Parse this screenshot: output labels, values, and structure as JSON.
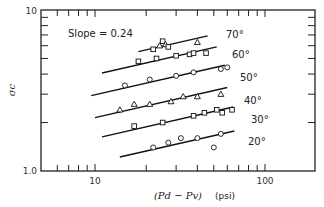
{
  "chart_data": {
    "type": "scatter",
    "title": "",
    "xlabel": "(P_d − P_v) (psi)",
    "ylabel": "σ_c",
    "xscale": "log",
    "yscale": "log",
    "xlim": [
      4.8,
      200
    ],
    "ylim": [
      1.0,
      10
    ],
    "x_tick_labels": [
      "10",
      "100"
    ],
    "y_tick_labels": [
      "1.0",
      "10"
    ],
    "grid": false,
    "legend": "none (series labeled at line ends)",
    "annotations": [
      {
        "text": "Slope = 0.24"
      }
    ],
    "series": [
      {
        "name": "70°",
        "marker": "triangle/square",
        "fit_slope": 0.24,
        "x": [
          22,
          24,
          25,
          26,
          27,
          40
        ],
        "y": [
          5.7,
          6.0,
          6.4,
          6.1,
          5.9,
          6.3
        ]
      },
      {
        "name": "60°",
        "marker": "square",
        "fit_slope": 0.24,
        "x": [
          18,
          23,
          30,
          36,
          38,
          45
        ],
        "y": [
          4.8,
          5.0,
          5.2,
          5.3,
          5.4,
          5.4
        ]
      },
      {
        "name": "50°",
        "marker": "circle",
        "fit_slope": 0.24,
        "x": [
          15,
          21,
          30,
          38,
          55,
          60
        ],
        "y": [
          3.4,
          3.7,
          3.9,
          4.1,
          4.3,
          4.4
        ]
      },
      {
        "name": "40°",
        "marker": "triangle",
        "fit_slope": 0.24,
        "x": [
          14,
          17,
          21,
          28,
          33,
          40,
          55
        ],
        "y": [
          2.4,
          2.6,
          2.6,
          2.7,
          2.9,
          2.9,
          3.0
        ]
      },
      {
        "name": "30°",
        "marker": "square",
        "fit_slope": 0.24,
        "x": [
          17,
          25,
          38,
          44,
          52,
          56,
          64
        ],
        "y": [
          1.9,
          2.0,
          2.2,
          2.3,
          2.4,
          2.3,
          2.4
        ]
      },
      {
        "name": "20°",
        "marker": "circle",
        "fit_slope": 0.24,
        "x": [
          22,
          27,
          32,
          40,
          50,
          55
        ],
        "y": [
          1.4,
          1.5,
          1.6,
          1.6,
          1.4,
          1.7
        ]
      }
    ]
  },
  "labels": {
    "slope_annotation": "Slope = 0.24",
    "y_axis_title": "σc",
    "x_axis_title": "(Pd − Pv)",
    "x_axis_unit": "(psi)",
    "x_ticks": [
      "10",
      "100"
    ],
    "y_ticks": [
      "1.0",
      "10"
    ],
    "series": [
      "70°",
      "60°",
      "50°",
      "40°",
      "30°",
      "20°"
    ]
  }
}
